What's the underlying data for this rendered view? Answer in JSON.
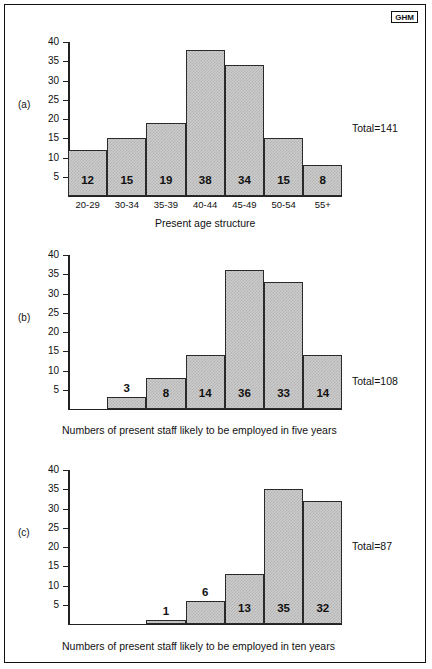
{
  "logo": {
    "text": "GHM"
  },
  "chart_data": [
    {
      "id": "a",
      "type": "bar",
      "panel_label": "(a)",
      "title": "",
      "xlabel": "Present age structure",
      "ylabel": "",
      "categories": [
        "20-29",
        "30-34",
        "35-39",
        "40-44",
        "45-49",
        "50-54",
        "55+"
      ],
      "values": [
        12,
        15,
        19,
        38,
        34,
        15,
        8
      ],
      "data_labels": [
        "12",
        "15",
        "19",
        "38",
        "34",
        "15",
        "8"
      ],
      "slot_offset": 0,
      "ylim": [
        0,
        40
      ],
      "yticks": [
        40,
        35,
        30,
        25,
        20,
        15,
        10,
        5
      ],
      "ytick_labels": [
        "40",
        "35",
        "30",
        "25",
        "20",
        "15",
        "10",
        "5"
      ],
      "grid": false,
      "total_label": "Total=141",
      "total_value": 141,
      "caption": ""
    },
    {
      "id": "b",
      "type": "bar",
      "panel_label": "(b)",
      "title": "",
      "xlabel": "",
      "ylabel": "",
      "categories": [
        "",
        "",
        "",
        "",
        "",
        "",
        ""
      ],
      "values": [
        3,
        8,
        14,
        36,
        33,
        14
      ],
      "data_labels": [
        "3",
        "8",
        "14",
        "36",
        "33",
        "14"
      ],
      "slot_offset": 1,
      "ylim": [
        0,
        40
      ],
      "yticks": [
        40,
        35,
        30,
        25,
        20,
        15,
        10,
        5
      ],
      "ytick_labels": [
        "40",
        "35",
        "30",
        "25",
        "20",
        "15",
        "10",
        "5"
      ],
      "grid": false,
      "total_label": "Total=108",
      "total_value": 108,
      "caption": "Numbers of present staff likely to be employed in five years"
    },
    {
      "id": "c",
      "type": "bar",
      "panel_label": "(c)",
      "title": "",
      "xlabel": "",
      "ylabel": "",
      "categories": [
        "",
        "",
        "",
        "",
        "",
        "",
        ""
      ],
      "values": [
        1,
        6,
        13,
        35,
        32
      ],
      "data_labels": [
        "1",
        "6",
        "13",
        "35",
        "32"
      ],
      "slot_offset": 2,
      "ylim": [
        0,
        40
      ],
      "yticks": [
        40,
        35,
        30,
        25,
        20,
        15,
        10,
        5
      ],
      "ytick_labels": [
        "40",
        "35",
        "30",
        "25",
        "20",
        "15",
        "10",
        "5"
      ],
      "grid": false,
      "total_label": "Total=87",
      "total_value": 87,
      "caption": "Numbers of present staff likely to be employed in ten years"
    }
  ]
}
